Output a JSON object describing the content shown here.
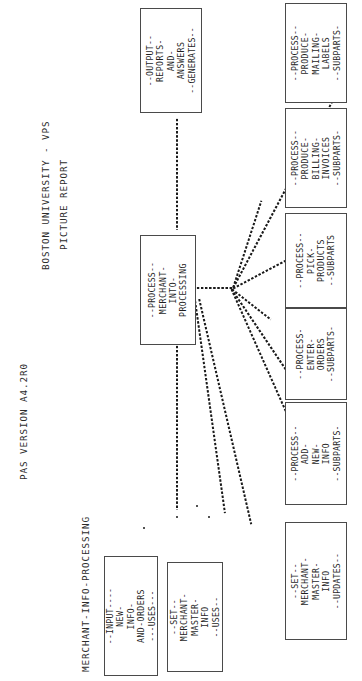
{
  "header": {
    "version": "PAS VERSION A4.2R0",
    "institution": "BOSTON UNIVERSITY - VPS",
    "report_title": "PICTURE REPORT",
    "subject": "MERCHANT-INFO-PROCESSING"
  },
  "boxes": {
    "output": {
      "name": "output-reports-and-answers",
      "top_rule": "--OUTPUT--",
      "lines": [
        "REPORTS-",
        "AND-",
        "ANSWERS"
      ],
      "bottom_rule": "--GENERATES--"
    },
    "central": {
      "name": "process-merchant-into-processing",
      "top_rule": "--PROCESS--",
      "lines": [
        "MERCHANT-",
        "INTO-",
        "PROCESSING"
      ],
      "bottom_rule": ""
    },
    "input_new_info": {
      "name": "input-new-info-and-orders",
      "top_rule": "--INPUT----",
      "lines": [
        "NEW-",
        "INFO-",
        "AND-ORDERS"
      ],
      "bottom_rule": "---USES---"
    },
    "set_master_uses": {
      "name": "set-merchant-master-info-uses",
      "top_rule": "--SET--",
      "lines": [
        "MERCHANT-",
        "MASTER-",
        "INFO"
      ],
      "bottom_rule": "--USES--"
    },
    "right": [
      {
        "name": "process-produce-mailing-labels",
        "top_rule": "--PROCESS--",
        "lines": [
          "PRODUCE-",
          "MAILING-",
          "LABELS"
        ],
        "bottom_rule": "--SUBPARTS-"
      },
      {
        "name": "process-produce-billing-invoices",
        "top_rule": "--PROCESS--",
        "lines": [
          "PRODUCE-",
          "BILLING-",
          "INVOICES"
        ],
        "bottom_rule": "--SUBPARTS-"
      },
      {
        "name": "process-pick-products",
        "top_rule": "--PROCESS--",
        "lines": [
          "PICK-",
          "PRODUCTS"
        ],
        "bottom_rule": "--SUBPARTS"
      },
      {
        "name": "process-enter-orders",
        "top_rule": "--PROCESS-",
        "lines": [
          "ENTER-",
          "ORDERS"
        ],
        "bottom_rule": "--SUBPARTS-"
      },
      {
        "name": "process-add-new-info",
        "top_rule": "--PROCESS--",
        "lines": [
          "ADD-",
          "NEW-",
          "INFO"
        ],
        "bottom_rule": "--SUBPARTS-"
      },
      {
        "name": "set-merchant-master-info-updates",
        "top_rule": "--SET--",
        "lines": [
          "MERCHANT-",
          "MASTER-",
          "INFO"
        ],
        "bottom_rule": "--UPDATES--"
      }
    ]
  }
}
